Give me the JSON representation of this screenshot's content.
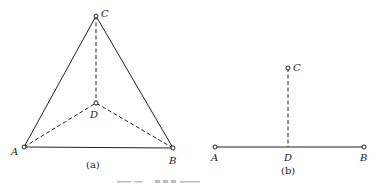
{
  "figure_a": {
    "caption": "(a)",
    "points": {
      "A": {
        "label": "A",
        "x": 24,
        "y": 147
      },
      "B": {
        "label": "B",
        "x": 173,
        "y": 148
      },
      "C": {
        "label": "C",
        "x": 96,
        "y": 16
      },
      "D": {
        "label": "D",
        "x": 96,
        "y": 103
      }
    },
    "solid_edges": [
      [
        "A",
        "B"
      ],
      [
        "A",
        "C"
      ],
      [
        "B",
        "C"
      ]
    ],
    "dashed_edges": [
      [
        "C",
        "D"
      ],
      [
        "A",
        "D"
      ],
      [
        "B",
        "D"
      ]
    ]
  },
  "figure_b": {
    "caption": "(b)",
    "points": {
      "A": {
        "label": "A",
        "x": 215,
        "y": 147
      },
      "B": {
        "label": "B",
        "x": 364,
        "y": 147
      },
      "C": {
        "label": "C",
        "x": 288,
        "y": 68
      },
      "D": {
        "label": "D",
        "x": 288,
        "y": 147
      }
    },
    "solid_edges": [
      [
        "A",
        "B"
      ]
    ],
    "dashed_edges": [
      [
        "C",
        "D"
      ]
    ]
  }
}
